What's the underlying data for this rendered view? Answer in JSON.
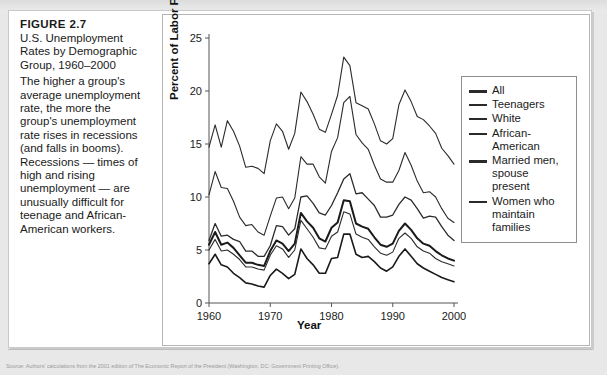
{
  "figure": {
    "label": "FIGURE 2.7",
    "title": "U.S. Unemployment Rates by Demographic Group, 1960–2000",
    "description": "The higher a group's average unemployment rate, the more the group's unemployment rate rises in recessions (and falls in booms). Recessions — times of high and rising unemployment — are unusually difficult for teenage and African-American workers.",
    "source": "Source: Authors' calculations from the 2001 edition of The Economic Report of the President (Washington, DC: Government Printing Office)."
  },
  "chart_data": {
    "type": "line",
    "title": "U.S. Unemployment Rates by Demographic Group, 1960–2000",
    "xlabel": "Year",
    "ylabel": "Percent of Labor Force",
    "xlim": [
      1960,
      2000
    ],
    "ylim": [
      0,
      25
    ],
    "xticks": [
      1960,
      1970,
      1980,
      1990,
      2000
    ],
    "yticks": [
      0,
      5,
      10,
      15,
      20,
      25
    ],
    "xtick_labels": [
      "1960",
      "1970",
      "1980",
      "1990",
      "2000"
    ],
    "ytick_labels": [
      "0",
      "5",
      "10",
      "15",
      "20",
      "25"
    ],
    "grid": false,
    "legend_position": "right-inside",
    "x": [
      1960,
      1961,
      1962,
      1963,
      1964,
      1965,
      1966,
      1967,
      1968,
      1969,
      1970,
      1971,
      1972,
      1973,
      1974,
      1975,
      1976,
      1977,
      1978,
      1979,
      1980,
      1981,
      1982,
      1983,
      1984,
      1985,
      1986,
      1987,
      1988,
      1989,
      1990,
      1991,
      1992,
      1993,
      1994,
      1995,
      1996,
      1997,
      1998,
      1999,
      2000
    ],
    "series": [
      {
        "name": "All",
        "color": "#1a1a1a",
        "width": 2.0,
        "values": [
          5.5,
          6.7,
          5.5,
          5.7,
          5.2,
          4.5,
          3.8,
          3.8,
          3.6,
          3.5,
          4.9,
          5.9,
          5.6,
          4.9,
          5.6,
          8.5,
          7.7,
          7.1,
          6.1,
          5.8,
          7.1,
          7.6,
          9.7,
          9.6,
          7.5,
          7.2,
          7.0,
          6.2,
          5.5,
          5.3,
          5.6,
          6.8,
          7.5,
          6.9,
          6.1,
          5.6,
          5.4,
          4.9,
          4.5,
          4.2,
          4.0
        ]
      },
      {
        "name": "Teenagers",
        "color": "#2b2b2b",
        "width": 1.1,
        "values": [
          14.7,
          16.8,
          14.7,
          17.2,
          16.2,
          14.8,
          12.8,
          12.9,
          12.7,
          12.2,
          15.3,
          16.9,
          16.2,
          14.5,
          16.0,
          19.9,
          19.0,
          17.8,
          16.4,
          16.1,
          17.8,
          19.6,
          23.2,
          22.4,
          18.9,
          18.6,
          18.3,
          16.9,
          15.3,
          15.0,
          15.5,
          18.7,
          20.1,
          19.0,
          17.6,
          17.3,
          16.7,
          16.0,
          14.6,
          13.9,
          13.1
        ]
      },
      {
        "name": "White",
        "color": "#2b2b2b",
        "width": 1.1,
        "values": [
          5.0,
          6.0,
          4.9,
          5.0,
          4.6,
          4.1,
          3.4,
          3.4,
          3.2,
          3.1,
          4.5,
          5.4,
          5.1,
          4.3,
          5.0,
          7.8,
          7.0,
          6.2,
          5.2,
          5.1,
          6.3,
          6.7,
          8.6,
          8.4,
          6.5,
          6.2,
          6.0,
          5.3,
          4.7,
          4.5,
          4.8,
          6.1,
          6.6,
          6.1,
          5.3,
          4.9,
          4.7,
          4.2,
          3.9,
          3.7,
          3.5
        ]
      },
      {
        "name": "African-\nAmerican",
        "color": "#2b2b2b",
        "width": 1.1,
        "values": [
          10.2,
          12.4,
          10.9,
          10.8,
          9.6,
          8.1,
          7.3,
          7.4,
          6.7,
          6.4,
          8.2,
          9.9,
          10.0,
          8.9,
          9.9,
          13.8,
          13.1,
          13.1,
          11.9,
          11.3,
          14.3,
          15.6,
          18.9,
          19.5,
          15.9,
          15.1,
          14.5,
          13.0,
          11.7,
          11.4,
          11.4,
          12.5,
          14.2,
          13.0,
          11.5,
          10.4,
          10.5,
          10.0,
          8.9,
          8.0,
          7.6
        ]
      },
      {
        "name": "Married men,\nspouse\npresent",
        "color": "#1a1a1a",
        "width": 1.6,
        "values": [
          3.7,
          4.6,
          3.6,
          3.4,
          2.8,
          2.4,
          1.9,
          1.8,
          1.6,
          1.5,
          2.6,
          3.2,
          2.8,
          2.3,
          2.7,
          5.1,
          4.2,
          3.6,
          2.8,
          2.8,
          4.2,
          4.3,
          6.5,
          6.5,
          4.6,
          4.3,
          4.4,
          3.9,
          3.3,
          3.0,
          3.4,
          4.4,
          5.1,
          4.4,
          3.7,
          3.3,
          3.0,
          2.7,
          2.4,
          2.2,
          2.0
        ]
      },
      {
        "name": "Women who\nmaintain\nfamilies",
        "color": "#2b2b2b",
        "width": 1.3,
        "values": [
          5.9,
          7.5,
          6.3,
          6.4,
          6.0,
          5.8,
          4.9,
          4.9,
          4.4,
          4.4,
          5.4,
          7.3,
          7.2,
          6.4,
          7.0,
          10.0,
          10.1,
          9.4,
          8.5,
          8.3,
          9.2,
          10.4,
          11.7,
          12.2,
          10.3,
          10.4,
          9.8,
          9.2,
          8.1,
          8.1,
          8.3,
          9.3,
          10.0,
          9.7,
          8.9,
          8.0,
          8.2,
          8.1,
          7.2,
          6.4,
          5.9
        ]
      }
    ]
  },
  "legend": {
    "items": [
      {
        "label": "All",
        "swatch_height": 3
      },
      {
        "label": "Teenagers",
        "swatch_height": 2
      },
      {
        "label": "White",
        "swatch_height": 2
      },
      {
        "label": "African-\nAmerican",
        "swatch_height": 2
      },
      {
        "label": "Married men,\nspouse\npresent",
        "swatch_height": 3
      },
      {
        "label": "Women who\nmaintain\nfamilies",
        "swatch_height": 2
      }
    ]
  }
}
